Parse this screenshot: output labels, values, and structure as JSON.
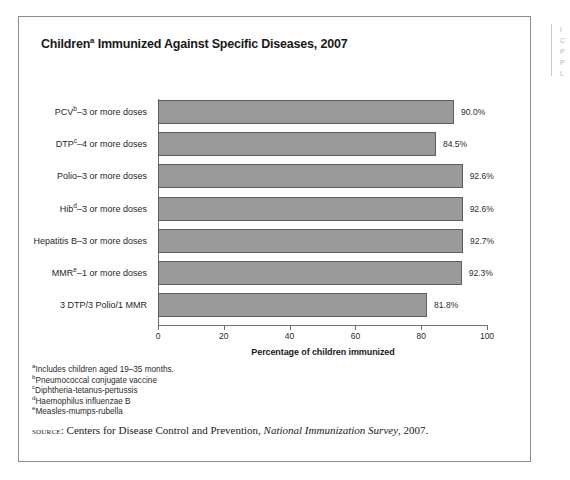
{
  "figure": {
    "title_main": "Children",
    "title_superscript": "a",
    "title_rest": " Immunized Against Specific Diseases, 2007"
  },
  "chart_data": {
    "type": "bar",
    "orientation": "horizontal",
    "xlabel": "Percentage of children immunized",
    "ylabel": "",
    "xlim": [
      0,
      100
    ],
    "xticks": [
      "0",
      "20",
      "40",
      "60",
      "80",
      "100"
    ],
    "grid": false,
    "legend": "none",
    "bar_color": "#9a9a9a",
    "bar_border_color": "#5e5e5e",
    "categories": [
      "PCV(b)–3 or more doses",
      "DTP(c)–4 or more doses",
      "Polio–3 or more doses",
      "Hib(d)–3 or more doses",
      "Hepatitis B–3 or more doses",
      "MMR(e)–1 or more doses",
      "3 DTP/3 Polio/1 MMR"
    ],
    "values": [
      90.0,
      84.5,
      92.6,
      92.6,
      92.7,
      92.3,
      81.8
    ],
    "value_labels": [
      "90.0%",
      "84.5%",
      "92.6%",
      "92.6%",
      "92.7%",
      "92.3%",
      "81.8%"
    ],
    "bars": [
      {
        "label_prefix": "PCV",
        "label_sup": "b",
        "label_suffix": "–3 or more doses",
        "value": 90.0,
        "value_label": "90.0%"
      },
      {
        "label_prefix": "DTP",
        "label_sup": "c",
        "label_suffix": "–4 or more doses",
        "value": 84.5,
        "value_label": "84.5%"
      },
      {
        "label_prefix": "Polio",
        "label_sup": "",
        "label_suffix": "–3 or more doses",
        "value": 92.6,
        "value_label": "92.6%"
      },
      {
        "label_prefix": "Hib",
        "label_sup": "d",
        "label_suffix": "–3 or more doses",
        "value": 92.6,
        "value_label": "92.6%"
      },
      {
        "label_prefix": "Hepatitis B",
        "label_sup": "",
        "label_suffix": "–3 or more doses",
        "value": 92.7,
        "value_label": "92.7%"
      },
      {
        "label_prefix": "MMR",
        "label_sup": "e",
        "label_suffix": "–1 or more doses",
        "value": 92.3,
        "value_label": "92.3%"
      },
      {
        "label_prefix": "3 DTP/3 Polio/1 MMR",
        "label_sup": "",
        "label_suffix": "",
        "value": 81.8,
        "value_label": "81.8%"
      }
    ]
  },
  "footnotes": [
    {
      "marker": "a",
      "text": "Includes children aged 19–35 months."
    },
    {
      "marker": "b",
      "text": "Pneumococcal conjugate vaccine"
    },
    {
      "marker": "c",
      "text": "Diphtheria-tetanus-pertussis"
    },
    {
      "marker": "d",
      "text": "Haemophilus influenzae B"
    },
    {
      "marker": "e",
      "text": "Measles-mumps-rubella"
    }
  ],
  "source": {
    "label": "source:",
    "text_before": " Centers for Disease Control and Prevention, ",
    "italic": "National Immunization Survey",
    "text_after": ", 2007."
  },
  "edge_fragment": {
    "lines": "I\nC\nP\nP\nL"
  }
}
